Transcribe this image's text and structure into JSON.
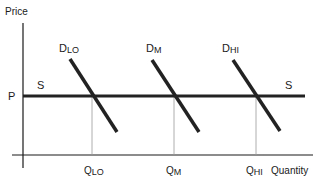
{
  "diagram": {
    "type": "supply-demand",
    "axes": {
      "y_label": "Price",
      "x_label": "Quantity"
    },
    "price_label": "P",
    "supply": {
      "label_left": "S",
      "label_right": "S"
    },
    "demand_curves": [
      {
        "main": "D",
        "sub": "LO",
        "quantity_main": "Q",
        "quantity_sub": "LO"
      },
      {
        "main": "D",
        "sub": "M",
        "quantity_main": "Q",
        "quantity_sub": "M"
      },
      {
        "main": "D",
        "sub": "HI",
        "quantity_main": "Q",
        "quantity_sub": "HI"
      }
    ],
    "colors": {
      "axis": "#1a1a1a",
      "curve": "#222222",
      "guide": "#9a9a9a"
    }
  }
}
